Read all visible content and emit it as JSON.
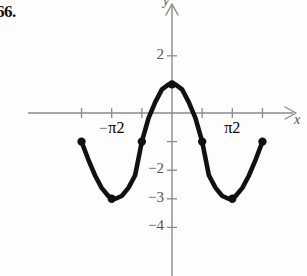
{
  "problem": {
    "number": "66."
  },
  "axes": {
    "x_label": "x",
    "y_label": "y",
    "x_tick_labels": [
      {
        "text": "-π/2",
        "sign": "−",
        "numerator": "π",
        "denominator": "2",
        "value": -1.5708
      },
      {
        "text": "π/2",
        "sign": "",
        "numerator": "π",
        "denominator": "2",
        "value": 1.5708
      }
    ],
    "y_tick_labels": [
      {
        "text": "2",
        "value": 2
      },
      {
        "text": "−2",
        "value": -2
      },
      {
        "text": "−3",
        "value": -3
      },
      {
        "text": "−4",
        "value": -4
      }
    ],
    "x_tick_values": [
      -2.3562,
      -1.5708,
      -0.7854,
      0.7854,
      1.5708,
      2.3562
    ],
    "y_tick_values": [
      2,
      1,
      -1,
      -2,
      -3,
      -4
    ],
    "xlim": [
      -3.05,
      3.05
    ],
    "ylim": [
      -4.85,
      2.6
    ],
    "axis_color": "#8a8a8a",
    "tick_color": "#8a8a8a"
  },
  "chart_data": {
    "type": "line",
    "title": "",
    "xlabel": "x",
    "ylabel": "y",
    "grid": false,
    "legend": null,
    "curve_color": "#111111",
    "point_color": "#111111",
    "function": "y = 2cos(2x) − 1",
    "amplitude": 2,
    "midline": -1,
    "period": 3.14159,
    "maximum": 1,
    "minimum": -3,
    "domain": [
      -2.3562,
      2.3562
    ],
    "marked_points": [
      {
        "x": -2.3562,
        "y": -1
      },
      {
        "x": -1.5708,
        "y": -3
      },
      {
        "x": -0.7854,
        "y": -1
      },
      {
        "x": 0,
        "y": 1
      },
      {
        "x": 0.7854,
        "y": -1
      },
      {
        "x": 1.5708,
        "y": -3
      },
      {
        "x": 2.3562,
        "y": -1
      }
    ],
    "x": [
      -2.3562,
      -2.1817,
      -2.0071,
      -1.8326,
      -1.6581,
      -1.4835,
      -1.309,
      -1.1345,
      -0.9599,
      -0.7854,
      -0.6109,
      -0.4363,
      -0.2618,
      -0.0873,
      0.0873,
      0.2618,
      0.4363,
      0.6109,
      0.7854,
      0.9599,
      1.1345,
      1.309,
      1.4835,
      1.6581,
      1.8326,
      2.0071,
      2.1817,
      2.3562
    ],
    "y": [
      -1.0,
      -1.618,
      -2.176,
      -2.618,
      -2.902,
      -3.0,
      -2.902,
      -2.618,
      -2.176,
      -1.0,
      -0.176,
      0.382,
      0.824,
      1.0,
      1.0,
      0.824,
      0.382,
      -0.176,
      -1.0,
      -2.176,
      -2.618,
      -2.902,
      -3.0,
      -2.902,
      -2.618,
      -2.176,
      -1.618,
      -1.0
    ]
  }
}
